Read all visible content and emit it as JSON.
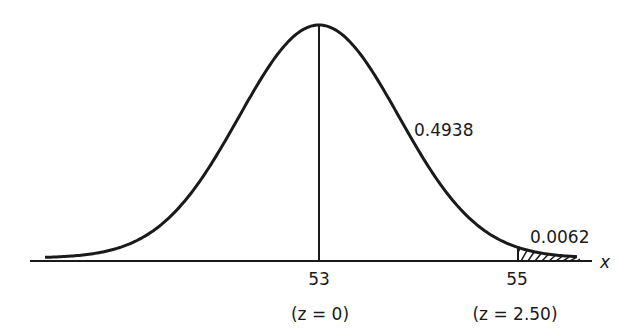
{
  "diagram": {
    "type": "normal-distribution-curve",
    "axis_label": "x",
    "mean_tick": "53",
    "mean_z": "(z = 0)",
    "value_tick": "55",
    "value_z": "(z = 2.50)",
    "area_center_to_value": "0.4938",
    "tail_area": "0.0062",
    "colors": {
      "ink": "#1a1a1a",
      "background": "#ffffff"
    }
  }
}
